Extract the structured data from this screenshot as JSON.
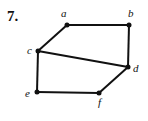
{
  "problem_number": "7.",
  "graph": {
    "vertices": [
      {
        "id": "a",
        "label": "a",
        "x": 67,
        "y": 25,
        "lx": 61,
        "ly": 17
      },
      {
        "id": "b",
        "label": "b",
        "x": 129,
        "y": 25,
        "lx": 128,
        "ly": 17
      },
      {
        "id": "c",
        "label": "c",
        "x": 38,
        "y": 51,
        "lx": 27,
        "ly": 54
      },
      {
        "id": "d",
        "label": "d",
        "x": 128,
        "y": 67,
        "lx": 133,
        "ly": 72
      },
      {
        "id": "e",
        "label": "e",
        "x": 37,
        "y": 92,
        "lx": 25,
        "ly": 97
      },
      {
        "id": "f",
        "label": "f",
        "x": 99,
        "y": 93,
        "lx": 98,
        "ly": 106
      }
    ],
    "edges": [
      [
        "a",
        "b"
      ],
      [
        "b",
        "d"
      ],
      [
        "a",
        "c"
      ],
      [
        "c",
        "d"
      ],
      [
        "c",
        "e"
      ],
      [
        "e",
        "f"
      ],
      [
        "f",
        "d"
      ]
    ]
  }
}
